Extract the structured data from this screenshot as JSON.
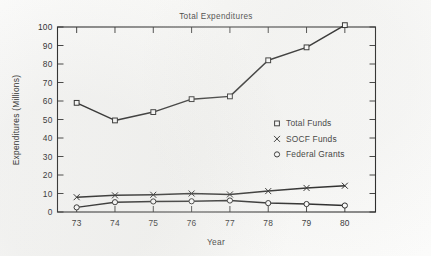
{
  "chart_data": {
    "type": "line",
    "title": "Total Expenditures",
    "xlabel": "Year",
    "ylabel": "Expenditures (Millions)",
    "x": [
      73,
      74,
      75,
      76,
      77,
      78,
      79,
      80
    ],
    "categories": [
      "73",
      "74",
      "75",
      "76",
      "77",
      "78",
      "79",
      "80"
    ],
    "xlim": [
      72.5,
      80.8
    ],
    "ylim": [
      0,
      100
    ],
    "yticks": [
      0,
      10,
      20,
      30,
      40,
      50,
      60,
      70,
      80,
      90,
      100
    ],
    "ytick_labels": [
      "0",
      "10",
      "20",
      "30",
      "40",
      "50",
      "60",
      "70",
      "80",
      "90",
      "100"
    ],
    "grid": false,
    "legend_position": "center-right",
    "series": [
      {
        "name": "Total Funds",
        "marker": "square",
        "values": [
          59,
          49.5,
          54,
          61,
          62.5,
          82,
          89,
          101
        ]
      },
      {
        "name": "SOCF Funds",
        "marker": "x",
        "values": [
          8,
          9,
          9.3,
          10,
          9.5,
          11.3,
          13,
          14.2
        ]
      },
      {
        "name": "Federal Grants",
        "marker": "circle",
        "values": [
          2.5,
          5.3,
          5.7,
          5.8,
          6.2,
          4.8,
          4.3,
          3.5
        ]
      }
    ]
  },
  "legend": {
    "entries": [
      {
        "label": "Total Funds",
        "marker": "square-marker"
      },
      {
        "label": "SOCF Funds",
        "marker": "x-marker"
      },
      {
        "label": "Federal Grants",
        "marker": "circle-marker"
      }
    ]
  },
  "colors": {
    "ink": "#141414",
    "paper": "#fbfbfa",
    "marker_fill": "#ffffff"
  }
}
